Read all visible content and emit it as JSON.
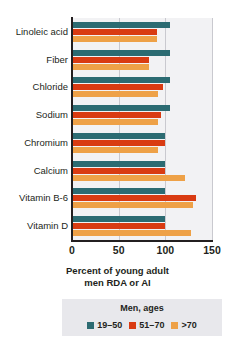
{
  "chart_data": {
    "type": "bar",
    "orientation": "horizontal",
    "title": "",
    "xlabel": "Percent of young adult men RDA or AI",
    "ylabel": "",
    "xlim": [
      0,
      150
    ],
    "xticks": [
      0,
      50,
      100,
      150
    ],
    "xtick_labels": [
      "0",
      "50",
      "100",
      "150"
    ],
    "grid": true,
    "grid_axis": "x",
    "legend_position": "bottom",
    "legend_title": "Men, ages",
    "categories": [
      "Linoleic acid",
      "Fiber",
      "Chloride",
      "Sodium",
      "Chromium",
      "Calcium",
      "Vitamin B-6",
      "Vitamin D"
    ],
    "series": [
      {
        "name": "19–50",
        "color": "#2c6b72",
        "values": [
          105,
          105,
          105,
          105,
          100,
          100,
          100,
          100
        ]
      },
      {
        "name": "51–70",
        "color": "#d93b12",
        "values": [
          91,
          83,
          98,
          95,
          100,
          100,
          133,
          100
        ]
      },
      {
        "name": ">70",
        "color": "#eea147",
        "values": [
          91,
          83,
          92,
          92,
          92,
          121,
          130,
          128
        ]
      }
    ]
  },
  "axis_title_lines": [
    "Percent of young adult",
    "men RDA or AI"
  ],
  "legend": {
    "title": "Men, ages",
    "items": [
      {
        "label": "19–50",
        "color": "#2c6b72"
      },
      {
        "label": "51–70",
        "color": "#d93b12"
      },
      {
        "label": ">70",
        "color": "#eea147"
      }
    ]
  }
}
